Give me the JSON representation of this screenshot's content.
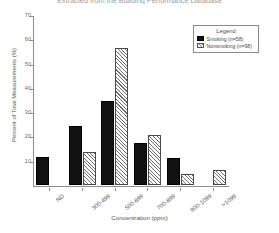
{
  "chart_data": {
    "type": "bar",
    "title": "Extracted from the Building Performance Database",
    "xlabel": "Concentration (ppm)",
    "ylabel": "Percent of Total Measurements (%)",
    "categories": [
      "ND",
      "300-499",
      "500-699",
      "700-899",
      "900-1099",
      ">1099"
    ],
    "series": [
      {
        "name": "Smoking (n=58)",
        "values": [
          11.5,
          24.5,
          34.5,
          17.5,
          11.0,
          0.0
        ]
      },
      {
        "name": "Nonsmoking (n=98)",
        "values": [
          0.0,
          13.5,
          56.5,
          20.5,
          4.5,
          6.0
        ]
      }
    ],
    "ylim": [
      0,
      70
    ],
    "yticks": [
      10,
      20,
      30,
      40,
      50,
      60,
      70
    ],
    "ytick_labels": [
      "10",
      "20",
      "30",
      "40",
      "50",
      "60",
      "70"
    ],
    "grid": false,
    "legend": {
      "title": "Legend",
      "position": "top-right",
      "entries": [
        {
          "label": "Smoking (n=58)",
          "swatch": "solid-black"
        },
        {
          "label": "Nonsmoking (n=98)",
          "swatch": "hatched"
        }
      ]
    },
    "colors": {
      "smoking": "#121212",
      "nonsmoking": "#ffffff",
      "axis": "#8f8f8f",
      "text": "#555555"
    }
  }
}
